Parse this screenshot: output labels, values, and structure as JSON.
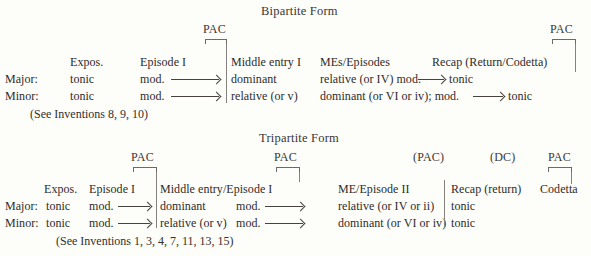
{
  "page": {
    "background": "#fdfdfa",
    "ink": "#2e2c2a",
    "rule": "#6d6a66"
  },
  "bipartite": {
    "title": "Bipartite Form",
    "cadence_markers": [
      {
        "label": "PAC"
      },
      {
        "label": "PAC"
      }
    ],
    "column_headers": [
      "Expos.",
      "Episode I",
      "Middle entry I",
      "MEs/Episodes",
      "Recap (Return/Codetta)"
    ],
    "rows": [
      {
        "mode": "Major:",
        "expos": "tonic",
        "episode": "mod.",
        "middle_entry": "dominant",
        "mes_episodes_a": "relative (or IV) mod.",
        "mes_episodes_b": "tonic"
      },
      {
        "mode": "Minor:",
        "expos": "tonic",
        "episode": "mod.",
        "middle_entry": "relative (or v)",
        "mes_episodes_a": "dominant (or VI or iv); mod.",
        "mes_episodes_b": "tonic"
      }
    ],
    "footnote": "(See Inventions 8, 9, 10)"
  },
  "tripartite": {
    "title": "Tripartite Form",
    "cadence_markers": [
      {
        "label": "PAC"
      },
      {
        "label": "PAC"
      },
      {
        "label": "(PAC)"
      },
      {
        "label": "(DC)"
      },
      {
        "label": "PAC"
      }
    ],
    "column_headers": [
      "Expos.",
      "Episode I",
      "Middle entry/Episode I",
      "ME/Episode II",
      "Recap (return)",
      "Codetta"
    ],
    "rows": [
      {
        "mode": "Major:",
        "expos": "tonic",
        "episode": "mod.",
        "middle_entry": "dominant",
        "middle_mod": "mod.",
        "me_episode_ii": "relative (or IV or ii)",
        "recap": "tonic"
      },
      {
        "mode": "Minor:",
        "expos": "tonic",
        "episode": "mod.",
        "middle_entry": "relative (or v)",
        "middle_mod": "mod.",
        "me_episode_ii": "dominant (or VI or iv)",
        "recap": "tonic"
      }
    ],
    "footnote": "(See Inventions 1, 3, 4, 7, 11, 13, 15)"
  }
}
